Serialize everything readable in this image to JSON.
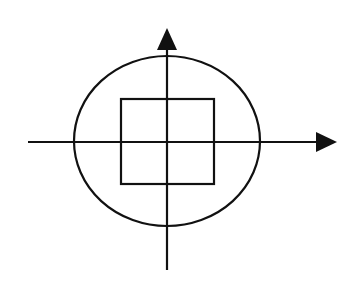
{
  "diagram": {
    "type": "geometric-figure",
    "canvas": {
      "width": 357,
      "height": 282,
      "background": "#ffffff"
    },
    "stroke_color": "#111111",
    "origin": {
      "x": 167,
      "y": 142
    },
    "x_axis": {
      "x1": 28,
      "y": 142,
      "x2": 318,
      "arrow_tip_x": 337,
      "arrow": "right"
    },
    "y_axis": {
      "x": 167,
      "y1": 270,
      "y2": 48,
      "arrow_tip_y": 28,
      "arrow": "up"
    },
    "circle": {
      "cx": 167,
      "cy": 141,
      "rx": 93,
      "ry": 85
    },
    "square": {
      "x": 121,
      "y": 99,
      "width": 93,
      "height": 85
    },
    "labels": []
  }
}
